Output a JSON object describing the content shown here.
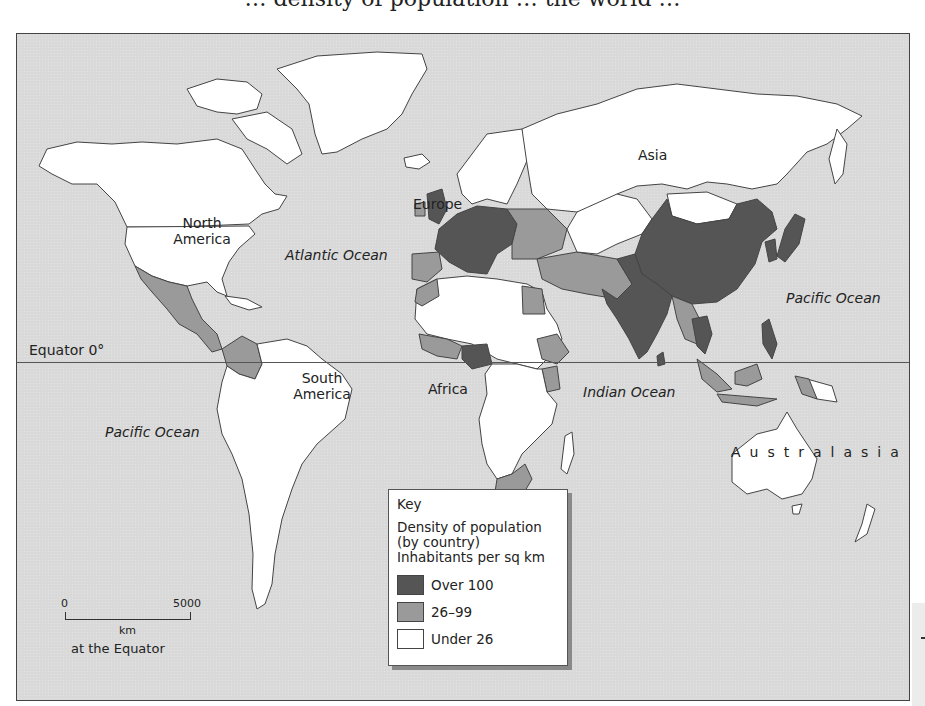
{
  "caption_fragment": "… density of population … the world …",
  "map": {
    "title": "World population density map",
    "colors": {
      "ocean": "#d9d9d9",
      "over_100": "#555555",
      "band_26_99": "#9a9a9a",
      "under_26": "#ffffff",
      "border": "#444444"
    },
    "continent_labels": {
      "north_america": [
        "North",
        "America"
      ],
      "south_america": [
        "South",
        "America"
      ],
      "europe": "Europe",
      "asia": "Asia",
      "africa": "Africa",
      "australasia": "Australasia"
    },
    "ocean_labels": {
      "atlantic": "Atlantic Ocean",
      "pacific_east": "Pacific Ocean",
      "pacific_west": "Pacific Ocean",
      "indian": "Indian Ocean"
    },
    "equator_label": "Equator 0°"
  },
  "key": {
    "title": "Key",
    "description": [
      "Density of population",
      "(by country)",
      "Inhabitants per sq km"
    ],
    "items": [
      {
        "label": "Over 100",
        "color": "#555555"
      },
      {
        "label": "26–99",
        "color": "#9a9a9a"
      },
      {
        "label": "Under 26",
        "color": "#ffffff"
      }
    ]
  },
  "scale": {
    "start": "0",
    "end": "5000",
    "unit": "km",
    "note": "at the Equator"
  }
}
